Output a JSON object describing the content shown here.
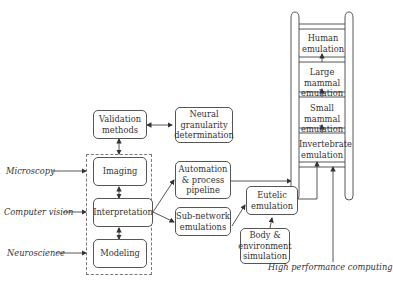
{
  "inputs": {
    "microscopy": "Microscopy",
    "computer_vision": "Computer vision",
    "neuroscience": "Neuroscience"
  },
  "boxes": {
    "validation": "Validation methods",
    "neural": "Neural granularity determination",
    "imaging": "Imaging",
    "interpretation": "Interpretation",
    "modeling": "Modeling",
    "automation": "Automation & process pipeline",
    "subnetwork": "Sub-network emulations",
    "eutelic": "Eutelic emulation",
    "body": "Body & environment simulation"
  },
  "ladder": {
    "rungs": [
      "Human emulation",
      "Large mammal emulation",
      "Small mammal emulation",
      "Invertebrate emulation"
    ]
  },
  "footer": {
    "hpc": "High performance computing"
  },
  "colors": {
    "line": "#444444",
    "box_border": "#555555"
  }
}
